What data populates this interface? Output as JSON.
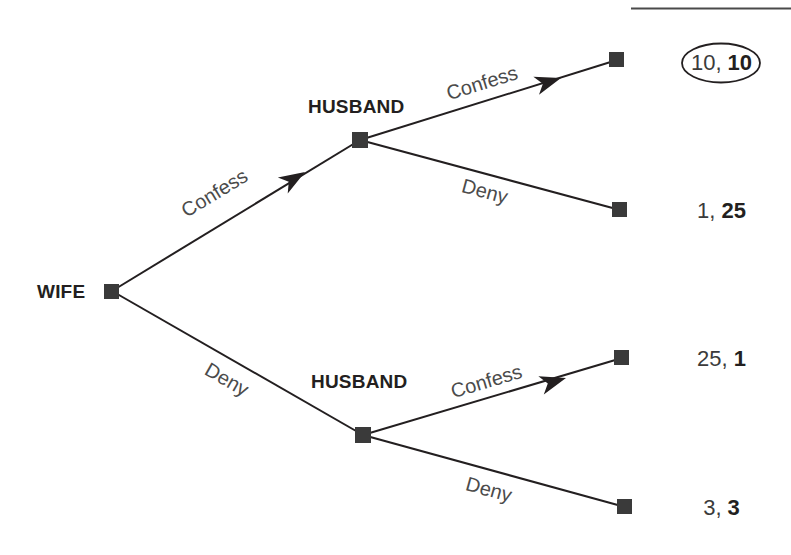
{
  "diagram": {
    "title_rule_visible": true,
    "root_player": "WIFE",
    "decision_players": {
      "upper": "HUSBAND",
      "lower": "HUSBAND"
    },
    "actions": {
      "wife_upper": "Confess",
      "wife_lower": "Deny",
      "husband_upper_up": "Confess",
      "husband_upper_down": "Deny",
      "husband_lower_up": "Confess",
      "husband_lower_down": "Deny"
    },
    "payoffs": [
      {
        "id": "cc",
        "text": "10, 10",
        "first": "10",
        "second": "10",
        "circled": true
      },
      {
        "id": "cd",
        "text": "1, 25",
        "first": "1",
        "second": "25",
        "circled": false
      },
      {
        "id": "dc",
        "text": "25, 1",
        "first": "25",
        "second": "1",
        "circled": false
      },
      {
        "id": "dd",
        "text": "3, 3",
        "first": "3",
        "second": "3",
        "circled": false
      }
    ],
    "colors": {
      "node_fill": "#3a3a3a",
      "edge_stroke": "#231f20",
      "label_text": "#4b4b4b",
      "player_text": "#231f20",
      "payoff_text": "#3b3b3b",
      "rule": "#4a4a4a"
    }
  }
}
